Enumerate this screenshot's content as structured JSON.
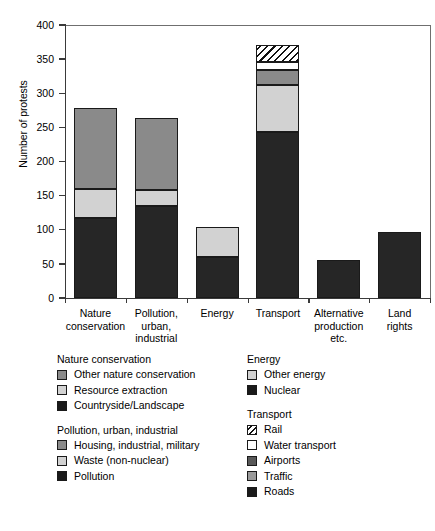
{
  "chart_data": {
    "type": "bar",
    "title": "",
    "subtitle": "",
    "xlabel": "",
    "ylabel": "Number of protests",
    "ylim": [
      0,
      400
    ],
    "yticks": [
      0,
      50,
      100,
      150,
      200,
      250,
      300,
      350,
      400
    ],
    "ytick_labels": [
      "0",
      "50",
      "100",
      "150",
      "200",
      "250",
      "300",
      "350",
      "400"
    ],
    "grid": false,
    "legend_position": "below",
    "stacked": true,
    "categories": [
      "Nature\nconservation",
      "Pollution,\nurban,\nindustrial",
      "Energy",
      "Transport",
      "Alternative\nproduction\netc.",
      "Land\nrights"
    ],
    "bars": [
      {
        "category": "Nature conservation",
        "total": 278,
        "segments": [
          {
            "label": "Countryside/Landscape",
            "value": 117,
            "color": "#262626",
            "fill": "solid"
          },
          {
            "label": "Resource extraction",
            "value": 43,
            "color": "#d2d2d2",
            "fill": "solid"
          },
          {
            "label": "Other nature conservation",
            "value": 118,
            "color": "#8a8a8a",
            "fill": "solid"
          }
        ]
      },
      {
        "category": "Pollution, urban, industrial",
        "total": 264,
        "segments": [
          {
            "label": "Pollution",
            "value": 135,
            "color": "#262626",
            "fill": "solid"
          },
          {
            "label": "Waste (non-nuclear)",
            "value": 23,
            "color": "#d2d2d2",
            "fill": "solid"
          },
          {
            "label": "Housing, industrial, military",
            "value": 106,
            "color": "#8a8a8a",
            "fill": "solid"
          }
        ]
      },
      {
        "category": "Energy",
        "total": 104,
        "segments": [
          {
            "label": "Nuclear",
            "value": 60,
            "color": "#262626",
            "fill": "solid"
          },
          {
            "label": "Other energy",
            "value": 44,
            "color": "#d2d2d2",
            "fill": "solid"
          }
        ]
      },
      {
        "category": "Transport",
        "total": 371,
        "segments": [
          {
            "label": "Roads",
            "value": 243,
            "color": "#262626",
            "fill": "solid"
          },
          {
            "label": "Traffic",
            "value": 69,
            "color": "#d2d2d2",
            "fill": "solid"
          },
          {
            "label": "Airports",
            "value": 22,
            "color": "#8a8a8a",
            "fill": "solid"
          },
          {
            "label": "Water transport",
            "value": 12,
            "color": "#ffffff",
            "fill": "solid"
          },
          {
            "label": "Rail",
            "value": 25,
            "color": "#ffffff",
            "fill": "hatch"
          }
        ]
      },
      {
        "category": "Alternative production etc.",
        "total": 55,
        "segments": [
          {
            "label": "Alternative production etc.",
            "value": 55,
            "color": "#262626",
            "fill": "solid"
          }
        ]
      },
      {
        "category": "Land rights",
        "total": 96,
        "segments": [
          {
            "label": "Land rights",
            "value": 96,
            "color": "#262626",
            "fill": "solid"
          }
        ]
      }
    ],
    "legend_groups": [
      {
        "title": "Nature conservation",
        "column": "left",
        "items": [
          {
            "label": "Other nature conservation",
            "color": "#8a8a8a",
            "fill": "solid"
          },
          {
            "label": "Resource extraction",
            "color": "#d2d2d2",
            "fill": "solid"
          },
          {
            "label": "Countryside/Landscape",
            "color": "#1a1a1a",
            "fill": "solid"
          }
        ]
      },
      {
        "title": "Pollution, urban, industrial",
        "column": "left",
        "items": [
          {
            "label": "Housing, industrial, military",
            "color": "#8a8a8a",
            "fill": "solid"
          },
          {
            "label": "Waste (non-nuclear)",
            "color": "#d2d2d2",
            "fill": "solid"
          },
          {
            "label": "Pollution",
            "color": "#1a1a1a",
            "fill": "solid"
          }
        ]
      },
      {
        "title": "Energy",
        "column": "right",
        "items": [
          {
            "label": "Other energy",
            "color": "#d2d2d2",
            "fill": "solid"
          },
          {
            "label": "Nuclear",
            "color": "#1a1a1a",
            "fill": "solid"
          }
        ]
      },
      {
        "title": "Transport",
        "column": "right",
        "items": [
          {
            "label": "Rail",
            "color": "#ffffff",
            "fill": "hatch"
          },
          {
            "label": "Water transport",
            "color": "#ffffff",
            "fill": "solid"
          },
          {
            "label": "Airports",
            "color": "#585858",
            "fill": "solid"
          },
          {
            "label": "Traffic",
            "color": "#9a9a9a",
            "fill": "solid"
          },
          {
            "label": "Roads",
            "color": "#1a1a1a",
            "fill": "solid"
          }
        ]
      }
    ]
  }
}
